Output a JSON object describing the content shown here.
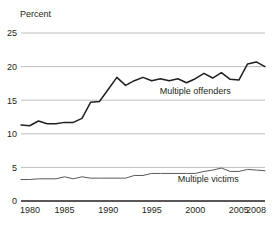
{
  "chart_data": {
    "type": "line",
    "title": "",
    "ylabel": "Percent",
    "xlabel": "",
    "ylim": [
      0,
      25
    ],
    "xlim": [
      1980,
      2008
    ],
    "yticks": [
      0,
      5,
      10,
      15,
      20,
      25
    ],
    "ytick_labels": [
      "0",
      "5",
      "10",
      "15",
      "20",
      "25"
    ],
    "xticks": [
      1980,
      1985,
      1990,
      1995,
      2000,
      2005,
      2008
    ],
    "xtick_labels": [
      "1980",
      "1985",
      "1990",
      "1995",
      "2000",
      "2005",
      "2008"
    ],
    "grid": "horizontal",
    "legend_position": "inline-annotation",
    "x": [
      1980,
      1981,
      1982,
      1983,
      1984,
      1985,
      1986,
      1987,
      1988,
      1989,
      1990,
      1991,
      1992,
      1993,
      1994,
      1995,
      1996,
      1997,
      1998,
      1999,
      2000,
      2001,
      2002,
      2003,
      2004,
      2005,
      2006,
      2007,
      2008
    ],
    "series": [
      {
        "name": "Multiple offenders",
        "color": "#231f20",
        "label_x": 2000,
        "label_y": 15.9,
        "values": [
          11.3,
          11.2,
          11.9,
          11.5,
          11.5,
          11.7,
          11.7,
          12.3,
          14.7,
          14.8,
          16.6,
          18.4,
          17.2,
          17.9,
          18.4,
          17.9,
          18.2,
          17.9,
          18.2,
          17.6,
          18.2,
          19.0,
          18.3,
          19.1,
          18.1,
          18.0,
          20.4,
          20.7,
          20.0
        ]
      },
      {
        "name": "Multiple victims",
        "color": "#58595b",
        "label_x": 2001.5,
        "label_y": 2.9,
        "values": [
          3.2,
          3.2,
          3.3,
          3.3,
          3.3,
          3.6,
          3.3,
          3.6,
          3.4,
          3.4,
          3.4,
          3.4,
          3.4,
          3.8,
          3.8,
          4.1,
          4.1,
          4.1,
          4.1,
          4.1,
          4.1,
          4.4,
          4.6,
          4.9,
          4.4,
          4.4,
          4.7,
          4.6,
          4.5
        ]
      }
    ]
  },
  "axis": {
    "unit_label": "Percent"
  },
  "colors": {
    "gridline": "#bcbec0",
    "axis": "#231f20",
    "text": "#231f20",
    "offenders": "#231f20",
    "victims": "#58595b"
  }
}
